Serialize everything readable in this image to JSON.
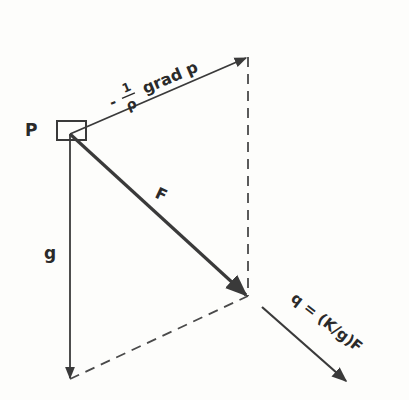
{
  "diagram": {
    "point_label": "P",
    "vectors": [
      {
        "name": "pressure-gradient",
        "label_prefix": "-",
        "label_frac_num": "1",
        "label_frac_den": "ρ",
        "label_suffix": "grad p"
      },
      {
        "name": "resultant-force",
        "label": "F"
      },
      {
        "name": "gravity",
        "label": "g"
      },
      {
        "name": "flux",
        "label": "q = (K/g)F"
      }
    ],
    "colors": {
      "line": "#3a3a3a",
      "background": "#fdfdfb"
    }
  }
}
